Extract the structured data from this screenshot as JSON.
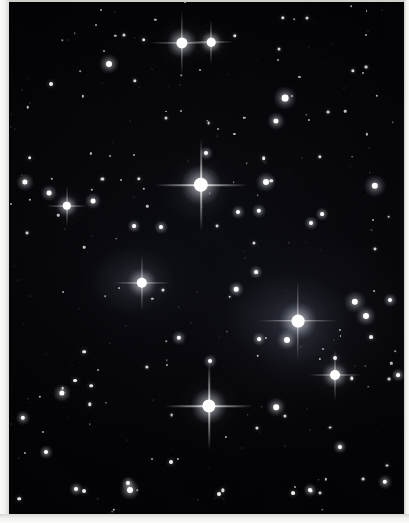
{
  "image": {
    "title": "Deep sky star field photograph",
    "subject": "open star field / wide-field astrophotograph",
    "width": 409,
    "height": 523,
    "background_color": "#050609",
    "star_color": "#ffffff",
    "border_color": "#f2f2f0",
    "border_widths": {
      "left": 9,
      "bottom": 9,
      "right": 5,
      "top": 2
    }
  },
  "sky": {
    "left": 9,
    "top": 2,
    "width": 395,
    "height": 512
  },
  "nebulosity": [
    {
      "name": "halo-around-bright-star-right",
      "x": 289,
      "y": 319,
      "rx": 62,
      "ry": 46,
      "opacity": 0.16,
      "color": "#9aa6c8"
    },
    {
      "name": "halo-around-star-left",
      "x": 133,
      "y": 281,
      "rx": 42,
      "ry": 34,
      "opacity": 0.15,
      "color": "#97a1bd"
    },
    {
      "name": "faint-glow-lower-right",
      "x": 300,
      "y": 350,
      "rx": 48,
      "ry": 36,
      "opacity": 0.07,
      "color": "#8b95b4"
    },
    {
      "name": "faint-glow-center",
      "x": 197,
      "y": 195,
      "rx": 34,
      "ry": 28,
      "opacity": 0.08,
      "color": "#9099b5"
    }
  ],
  "bright_stars": [
    {
      "name": "brightest-star-center",
      "x": 201,
      "y": 185,
      "r": 7.2,
      "glow": 19,
      "spike": 46,
      "spike_w": 1.6
    },
    {
      "name": "bright-star-lower-center",
      "x": 209,
      "y": 406,
      "r": 6.6,
      "glow": 17,
      "spike": 44,
      "spike_w": 1.5
    },
    {
      "name": "bright-star-right-nebulous",
      "x": 298,
      "y": 321,
      "r": 6.4,
      "glow": 18,
      "spike": 40,
      "spike_w": 1.4
    },
    {
      "name": "bright-star-top-left-pair-a",
      "x": 182,
      "y": 43,
      "r": 5.6,
      "glow": 14,
      "spike": 32,
      "spike_w": 1.2
    },
    {
      "name": "bright-star-left-nebulous",
      "x": 142,
      "y": 283,
      "r": 5.2,
      "glow": 14,
      "spike": 28,
      "spike_w": 1.1
    },
    {
      "name": "bright-star-top-pair-b",
      "x": 211,
      "y": 42,
      "r": 4.3,
      "glow": 10,
      "spike": 22,
      "spike_w": 1.0
    },
    {
      "name": "bright-star-lower-right",
      "x": 335,
      "y": 375,
      "r": 5.0,
      "glow": 12,
      "spike": 26,
      "spike_w": 1.0
    },
    {
      "name": "bright-star-left-mid",
      "x": 67,
      "y": 206,
      "r": 4.2,
      "glow": 10,
      "spike": 20,
      "spike_w": 0.9
    }
  ],
  "medium_stars": [
    {
      "name": "star-m01",
      "x": 109,
      "y": 64,
      "r": 3.0
    },
    {
      "name": "star-m02",
      "x": 285,
      "y": 98,
      "r": 3.4
    },
    {
      "name": "star-m03",
      "x": 276,
      "y": 121,
      "r": 2.6
    },
    {
      "name": "star-m04",
      "x": 25,
      "y": 182,
      "r": 2.6
    },
    {
      "name": "star-m05",
      "x": 49,
      "y": 193,
      "r": 2.4
    },
    {
      "name": "star-m06",
      "x": 93,
      "y": 201,
      "r": 2.4
    },
    {
      "name": "star-m07",
      "x": 266,
      "y": 182,
      "r": 3.0
    },
    {
      "name": "star-m08",
      "x": 375,
      "y": 186,
      "r": 3.2
    },
    {
      "name": "star-m09",
      "x": 259,
      "y": 211,
      "r": 2.2
    },
    {
      "name": "star-m10",
      "x": 238,
      "y": 212,
      "r": 2.0
    },
    {
      "name": "star-m11",
      "x": 161,
      "y": 227,
      "r": 2.0
    },
    {
      "name": "star-m12",
      "x": 236,
      "y": 289,
      "r": 2.3
    },
    {
      "name": "star-m13",
      "x": 256,
      "y": 272,
      "r": 1.9
    },
    {
      "name": "star-m14",
      "x": 355,
      "y": 302,
      "r": 3.2
    },
    {
      "name": "star-m15",
      "x": 366,
      "y": 316,
      "r": 3.0
    },
    {
      "name": "star-m16",
      "x": 287,
      "y": 340,
      "r": 3.0
    },
    {
      "name": "star-m17",
      "x": 276,
      "y": 407,
      "r": 2.8
    },
    {
      "name": "star-m18",
      "x": 62,
      "y": 393,
      "r": 2.6
    },
    {
      "name": "star-m19",
      "x": 23,
      "y": 418,
      "r": 2.2
    },
    {
      "name": "star-m20",
      "x": 46,
      "y": 452,
      "r": 2.0
    },
    {
      "name": "star-m21",
      "x": 130,
      "y": 490,
      "r": 3.0
    },
    {
      "name": "star-m22",
      "x": 76,
      "y": 489,
      "r": 2.0
    },
    {
      "name": "star-m23",
      "x": 310,
      "y": 490,
      "r": 2.0
    },
    {
      "name": "star-m24",
      "x": 385,
      "y": 482,
      "r": 2.2
    },
    {
      "name": "star-m25",
      "x": 206,
      "y": 153,
      "r": 2.0
    },
    {
      "name": "star-m26",
      "x": 322,
      "y": 214,
      "r": 1.9
    },
    {
      "name": "star-m27",
      "x": 390,
      "y": 300,
      "r": 2.0
    },
    {
      "name": "star-m28",
      "x": 179,
      "y": 338,
      "r": 2.2
    },
    {
      "name": "star-m29",
      "x": 210,
      "y": 361,
      "r": 2.0
    },
    {
      "name": "star-m30",
      "x": 134,
      "y": 226,
      "r": 1.9
    },
    {
      "name": "star-m31",
      "x": 311,
      "y": 223,
      "r": 2.0
    },
    {
      "name": "star-m32",
      "x": 259,
      "y": 339,
      "r": 1.9
    },
    {
      "name": "star-m33",
      "x": 340,
      "y": 447,
      "r": 2.1
    },
    {
      "name": "star-m34",
      "x": 398,
      "y": 375,
      "r": 1.9
    },
    {
      "name": "star-m35",
      "x": 128,
      "y": 483,
      "r": 2.0
    }
  ],
  "faint_star_count": 230,
  "faint_star_seed": 20240517
}
